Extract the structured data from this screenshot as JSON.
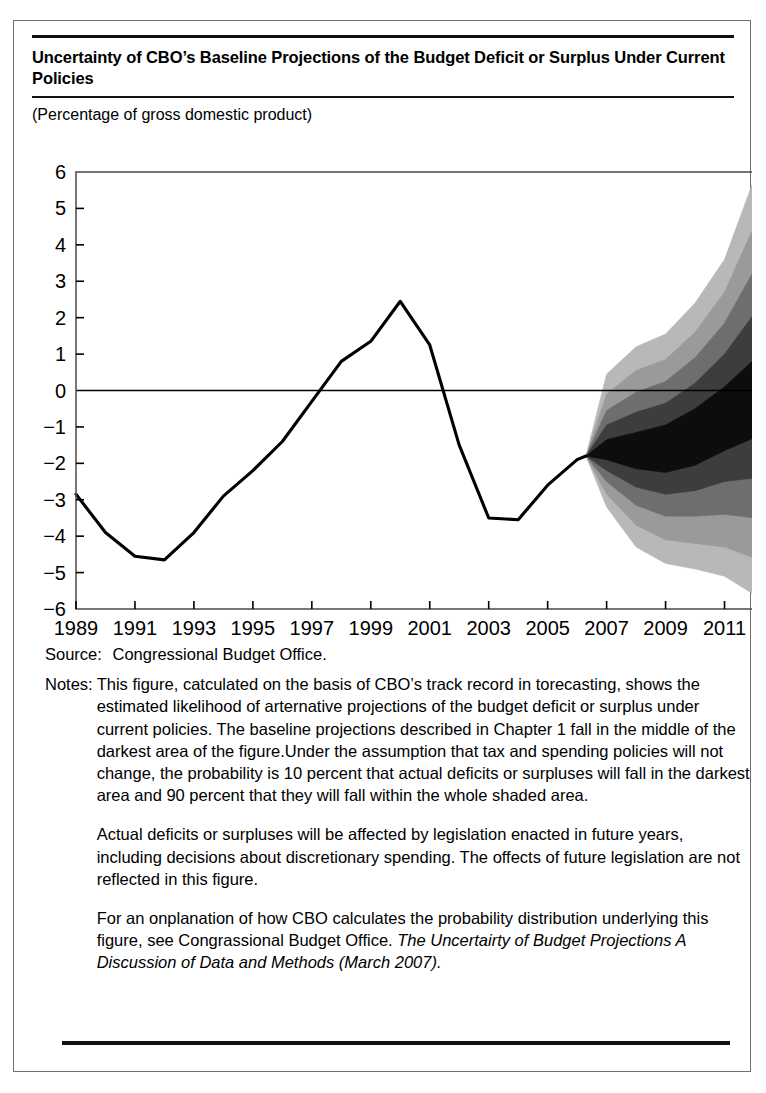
{
  "figure": {
    "title": "Uncertainty of CBO’s Baseline Projections of the Budget Deficit or Surplus Under Current Policies",
    "subtitle": "(Percentage of gross domestic product)",
    "source_label": "Source:",
    "source_text": "Congressional Budget Office.",
    "notes_label": "Notes:",
    "note_paragraphs": [
      "This figure, catculated on the basis of CBO’s track record in torecasting, shows the estimated likelihood of arternative projections of the budget deficit or surplus under current policies. The baseline projections described in Chapter 1 fall in the middle of the darkest area of the figure.Under the assumption that tax and spending policies will not change, the probability is 10 percent that actual deficits or surpluses will fall in the darkest area and 90 percent that they will fall within the whole shaded area.",
      "Actual deficits or surpluses will be affected by legislation enacted in future years, including decisions about discretionary spending. The offects of future legislation are not reflected in this figure.",
      "For an onplanation of how CBO calculates the probability distribution underlying this figure, see Congrassional Budget Office."
    ],
    "note_italic_tail": "The Uncertairty of Budget Projections A Discussion of Data and Methods (March 2007).",
    "colors": {
      "line": "#000000",
      "band_90": "#b8b8b8",
      "band_70": "#9a9a9a",
      "band_50": "#6e6e6e",
      "band_30": "#3d3d3d",
      "band_10": "#0d0d0d",
      "frame": "#555555",
      "zero_line": "#000000"
    }
  },
  "chart_data": {
    "type": "line",
    "title": "Uncertainty of CBO’s Baseline Projections of the Budget Deficit or Surplus Under Current Policies",
    "xlabel": "",
    "ylabel": "Percentage of gross domestic product",
    "xlim": [
      1989,
      2012
    ],
    "ylim": [
      -6,
      6
    ],
    "ytick_labels": [
      "6",
      "5",
      "4",
      "3",
      "2",
      "1",
      "0",
      "−1",
      "−2",
      "−3",
      "−4",
      "−5",
      "−6"
    ],
    "yticks": [
      6,
      5,
      4,
      3,
      2,
      1,
      0,
      -1,
      -2,
      -3,
      -4,
      -5,
      -6
    ],
    "xtick_labels": [
      "1989",
      "1991",
      "1993",
      "1995",
      "1997",
      "1999",
      "2001",
      "2003",
      "2005",
      "2007",
      "2009",
      "2011"
    ],
    "xticks": [
      1989,
      1991,
      1993,
      1995,
      1997,
      1999,
      2001,
      2003,
      2005,
      2007,
      2009,
      2011
    ],
    "grid": false,
    "zero_line": 0,
    "legend": "none",
    "series": [
      {
        "name": "Actual deficit or surplus",
        "x": [
          1989,
          1990,
          1991,
          1992,
          1993,
          1994,
          1995,
          1996,
          1997,
          1998,
          1999,
          2000,
          2001,
          2002,
          2003,
          2004,
          2005,
          2006,
          2006.3
        ],
        "values": [
          -2.85,
          -3.9,
          -4.55,
          -4.65,
          -3.9,
          -2.9,
          -2.2,
          -1.4,
          -0.3,
          0.8,
          1.35,
          2.45,
          1.25,
          -1.5,
          -3.5,
          -3.55,
          -2.6,
          -1.9,
          -1.8
        ]
      }
    ],
    "fan": {
      "origin_year": 2006.3,
      "origin_value": -1.8,
      "x": [
        2006.3,
        2007,
        2008,
        2009,
        2010,
        2011,
        2012
      ],
      "bands": [
        {
          "name": "90 percent interval",
          "probability": 90,
          "color": "#b8b8b8",
          "upper": [
            -1.8,
            0.45,
            1.2,
            1.55,
            2.4,
            3.6,
            5.8
          ],
          "lower": [
            -1.8,
            -3.2,
            -4.3,
            -4.75,
            -4.9,
            -5.1,
            -5.6
          ]
        },
        {
          "name": "70 percent interval",
          "probability": 70,
          "color": "#9a9a9a",
          "upper": [
            -1.8,
            -0.1,
            0.55,
            0.85,
            1.6,
            2.7,
            4.5
          ],
          "lower": [
            -1.8,
            -2.85,
            -3.7,
            -4.1,
            -4.2,
            -4.3,
            -4.6
          ]
        },
        {
          "name": "50 percent interval",
          "probability": 50,
          "color": "#6e6e6e",
          "upper": [
            -1.8,
            -0.55,
            -0.05,
            0.25,
            0.9,
            1.85,
            3.3
          ],
          "lower": [
            -1.8,
            -2.5,
            -3.15,
            -3.45,
            -3.45,
            -3.4,
            -3.5
          ]
        },
        {
          "name": "30 percent interval",
          "probability": 30,
          "color": "#3d3d3d",
          "upper": [
            -1.8,
            -0.95,
            -0.6,
            -0.35,
            0.2,
            1.0,
            2.1
          ],
          "lower": [
            -1.8,
            -2.2,
            -2.65,
            -2.85,
            -2.75,
            -2.5,
            -2.4
          ]
        },
        {
          "name": "10 percent interval (darkest)",
          "probability": 10,
          "color": "#0d0d0d",
          "upper": [
            -1.8,
            -1.35,
            -1.15,
            -0.95,
            -0.5,
            0.1,
            0.85
          ],
          "lower": [
            -1.8,
            -1.9,
            -2.15,
            -2.25,
            -2.05,
            -1.65,
            -1.3
          ]
        }
      ]
    }
  }
}
